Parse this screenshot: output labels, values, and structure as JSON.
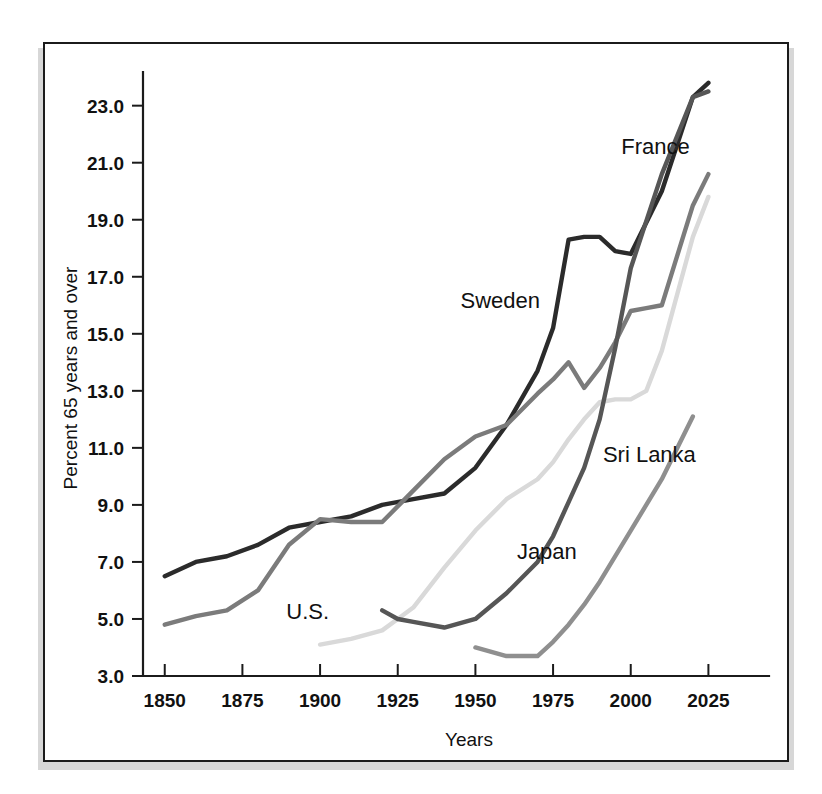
{
  "figure": {
    "frame_color": "#1b1b1b",
    "shadow_color": "#c9c9c9",
    "background": "#ffffff"
  },
  "chart_data": {
    "type": "line",
    "title": "",
    "xlabel": "Years",
    "ylabel": "Percent 65 years and over",
    "xlim": [
      1843,
      2040
    ],
    "ylim": [
      3.0,
      23.9
    ],
    "grid": false,
    "legend": "inline-labels",
    "xticks": [
      1850,
      1875,
      1900,
      1925,
      1950,
      1975,
      2000,
      2025
    ],
    "xtick_labels": [
      "1850",
      "1875",
      "1900",
      "1925",
      "1950",
      "1975",
      "2000",
      "2025"
    ],
    "yticks": [
      3.0,
      5.0,
      7.0,
      9.0,
      11.0,
      13.0,
      15.0,
      17.0,
      19.0,
      21.0,
      23.0
    ],
    "ytick_labels": [
      "3.0",
      "5.0",
      "7.0",
      "9.0",
      "11.0",
      "13.0",
      "15.0",
      "17.0",
      "19.0",
      "21.0",
      "23.0"
    ],
    "series": [
      {
        "name": "Sweden",
        "color": "#2b2b2b",
        "label_x": 1958,
        "label_y": 15.9,
        "x": [
          1850,
          1860,
          1870,
          1880,
          1890,
          1900,
          1910,
          1920,
          1930,
          1940,
          1950,
          1960,
          1970,
          1975,
          1980,
          1985,
          1990,
          1995,
          2000,
          2010,
          2020,
          2025
        ],
        "y": [
          6.5,
          7.0,
          7.2,
          7.6,
          8.2,
          8.4,
          8.6,
          9.0,
          9.2,
          9.4,
          10.3,
          11.8,
          13.7,
          15.2,
          18.3,
          18.4,
          18.4,
          17.9,
          17.8,
          20.0,
          23.3,
          23.8
        ]
      },
      {
        "name": "France",
        "color": "#7b7b7b",
        "label_x": 2008,
        "label_y": 21.3,
        "x": [
          1850,
          1860,
          1870,
          1880,
          1890,
          1900,
          1910,
          1920,
          1930,
          1940,
          1950,
          1960,
          1970,
          1975,
          1980,
          1985,
          1990,
          1995,
          2000,
          2005,
          2010,
          2020,
          2025
        ],
        "y": [
          4.8,
          5.1,
          5.3,
          6.0,
          7.6,
          8.5,
          8.4,
          8.4,
          9.5,
          10.6,
          11.4,
          11.8,
          12.9,
          13.4,
          14.0,
          13.1,
          13.8,
          14.7,
          15.8,
          15.9,
          16.0,
          19.5,
          20.6
        ]
      },
      {
        "name": "U.S.",
        "color": "#d9d9d9",
        "label_x": 1896,
        "label_y": 5.0,
        "x": [
          1900,
          1910,
          1920,
          1925,
          1930,
          1940,
          1950,
          1960,
          1970,
          1975,
          1980,
          1985,
          1990,
          1995,
          2000,
          2005,
          2010,
          2020,
          2025
        ],
        "y": [
          4.1,
          4.3,
          4.6,
          5.0,
          5.4,
          6.8,
          8.1,
          9.2,
          9.9,
          10.5,
          11.3,
          12.0,
          12.6,
          12.7,
          12.7,
          13.0,
          14.4,
          18.4,
          19.8
        ]
      },
      {
        "name": "Japan",
        "color": "#565656",
        "label_x": 1973,
        "label_y": 7.1,
        "x": [
          1920,
          1925,
          1930,
          1940,
          1950,
          1960,
          1970,
          1975,
          1980,
          1985,
          1990,
          1995,
          2000,
          2010,
          2020,
          2025
        ],
        "y": [
          5.3,
          5.0,
          4.9,
          4.7,
          5.0,
          5.9,
          7.0,
          7.9,
          9.1,
          10.3,
          12.0,
          14.5,
          17.3,
          20.6,
          23.3,
          23.5
        ]
      },
      {
        "name": "Sri Lanka",
        "color": "#8f8f8f",
        "label_x": 2006,
        "label_y": 10.5,
        "x": [
          1950,
          1960,
          1970,
          1975,
          1980,
          1985,
          1990,
          2000,
          2010,
          2020
        ],
        "y": [
          4.0,
          3.7,
          3.7,
          4.2,
          4.8,
          5.5,
          6.3,
          8.1,
          9.9,
          12.1
        ]
      }
    ]
  }
}
